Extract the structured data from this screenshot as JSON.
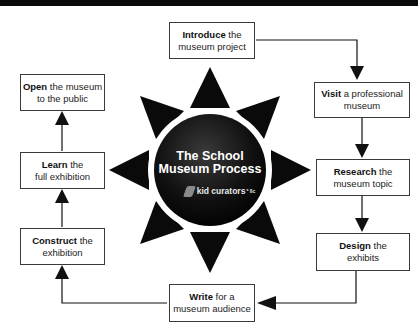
{
  "diagram": {
    "center": {
      "title_line1": "The School",
      "title_line2": "Museum Process",
      "logo_text": "kid curators",
      "logo_suffix": "* llc"
    },
    "steps": [
      {
        "bold": "Introduce",
        "rest1": " the",
        "rest2": "museum project"
      },
      {
        "bold": "Visit",
        "rest1": " a professional",
        "rest2": "museum"
      },
      {
        "bold": "Research",
        "rest1": " the",
        "rest2": "museum topic"
      },
      {
        "bold": "Design",
        "rest1": " the",
        "rest2": "exhibits"
      },
      {
        "bold": "Write",
        "rest1": " for a",
        "rest2": "museum audience"
      },
      {
        "bold": "Construct",
        "rest1": " the",
        "rest2": "exhibition"
      },
      {
        "bold": "Learn",
        "rest1": " the",
        "rest2": "full exhibition"
      },
      {
        "bold": "Open",
        "rest1": " the museum",
        "rest2": "to the public"
      }
    ],
    "flow_order": [
      "Introduce",
      "Visit",
      "Research",
      "Design",
      "Write",
      "Construct",
      "Learn",
      "Open"
    ],
    "colors": {
      "sun": "#0a0a0a",
      "box_border": "#3a3a3a",
      "arrow": "#111111",
      "background": "#ffffff"
    }
  }
}
